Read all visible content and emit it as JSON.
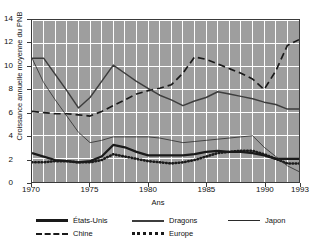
{
  "chart_data": {
    "type": "line",
    "title": "",
    "xlabel": "Ans",
    "ylabel": "Croissance annuelle moyenne du PNB",
    "xlim": [
      1970,
      1993
    ],
    "ylim": [
      0,
      14
    ],
    "yticks": [
      0,
      2,
      4,
      6,
      8,
      10,
      12,
      14
    ],
    "xticks": [
      1970,
      1975,
      1980,
      1985,
      1990,
      1993
    ],
    "grid": true,
    "legend_position": "below",
    "x": [
      1970,
      1971,
      1972,
      1973,
      1974,
      1975,
      1976,
      1977,
      1978,
      1979,
      1980,
      1981,
      1982,
      1983,
      1984,
      1985,
      1986,
      1987,
      1988,
      1989,
      1990,
      1991,
      1992,
      1993
    ],
    "series": [
      {
        "name": "États-Unis",
        "style": "solid-thick",
        "color": "#1a1a1a",
        "values": [
          2.5,
          2.2,
          1.9,
          1.8,
          1.7,
          1.8,
          2.2,
          3.2,
          3.0,
          2.6,
          2.3,
          2.3,
          2.3,
          2.3,
          2.4,
          2.6,
          2.7,
          2.6,
          2.6,
          2.5,
          2.3,
          2.0,
          2.0,
          2.0
        ]
      },
      {
        "name": "Chine",
        "style": "dashed",
        "color": "#1a1a1a",
        "values": [
          6.1,
          6.0,
          5.9,
          5.9,
          5.8,
          5.7,
          6.1,
          6.6,
          7.1,
          7.6,
          7.9,
          8.1,
          8.4,
          9.4,
          10.8,
          10.6,
          10.2,
          9.8,
          9.4,
          8.9,
          8.0,
          9.6,
          11.8,
          12.3
        ]
      },
      {
        "name": "Dragons",
        "style": "solid-medium",
        "color": "#3d3d3d",
        "values": [
          10.7,
          10.7,
          9.3,
          7.9,
          6.4,
          7.3,
          8.7,
          10.1,
          9.4,
          8.7,
          8.1,
          7.5,
          7.1,
          6.6,
          7.0,
          7.3,
          7.8,
          7.6,
          7.4,
          7.2,
          6.9,
          6.7,
          6.3,
          6.3
        ]
      },
      {
        "name": "Europe",
        "style": "dotted",
        "color": "#1a1a1a",
        "values": [
          1.7,
          1.7,
          1.8,
          1.8,
          1.7,
          1.7,
          1.9,
          2.4,
          2.2,
          2.0,
          1.8,
          1.7,
          1.6,
          1.7,
          1.9,
          2.2,
          2.5,
          2.6,
          2.7,
          2.7,
          2.4,
          2.0,
          1.6,
          1.6
        ]
      },
      {
        "name": "Japon",
        "style": "solid-thin",
        "color": "#2a2a2a",
        "values": [
          10.7,
          8.6,
          7.1,
          5.7,
          4.3,
          3.4,
          3.6,
          3.9,
          3.9,
          3.9,
          3.9,
          3.8,
          3.6,
          3.4,
          3.5,
          3.6,
          3.7,
          3.8,
          3.9,
          4.0,
          3.0,
          2.2,
          1.4,
          0.9
        ]
      }
    ]
  },
  "legend": {
    "items": [
      {
        "label": "États-Unis",
        "key": "solid-thick"
      },
      {
        "label": "Dragons",
        "key": "solid-medium"
      },
      {
        "label": "Japon",
        "key": "solid-thin"
      },
      {
        "label": "Chine",
        "key": "dashed"
      },
      {
        "label": "Europe",
        "key": "dotted"
      }
    ]
  }
}
